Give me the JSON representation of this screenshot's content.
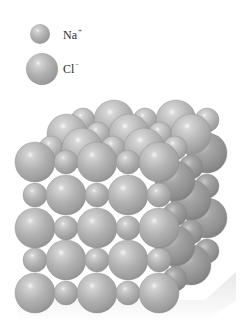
{
  "figure": {
    "type": "crystal-lattice-diagram"
  },
  "legend": {
    "items": [
      {
        "ion": "Na",
        "charge": "+",
        "size": "small",
        "cx": 40,
        "cy": 34,
        "r": 10
      },
      {
        "ion": "Cl",
        "charge": "−",
        "size": "large",
        "cx": 42,
        "cy": 69,
        "r": 16
      }
    ]
  },
  "colors": {
    "sphere_face": "#b4b4b4",
    "sphere_mid": "#9a9a9a",
    "sphere_edge": "#7a7a7a",
    "sphere_highlight": "#ffffff",
    "right_face_tint": "#8e8e8e",
    "label_text": "#2a2a2a",
    "background": "#ffffff"
  },
  "lattice": {
    "front_grid": {
      "cols_x": [
        35,
        66,
        97,
        128,
        159
      ],
      "rows_y": [
        162,
        195,
        228,
        260,
        293
      ],
      "big_r": 20,
      "small_r": 12
    },
    "depth_offset": {
      "dx": 16,
      "dy": -14
    },
    "layers": 4
  }
}
